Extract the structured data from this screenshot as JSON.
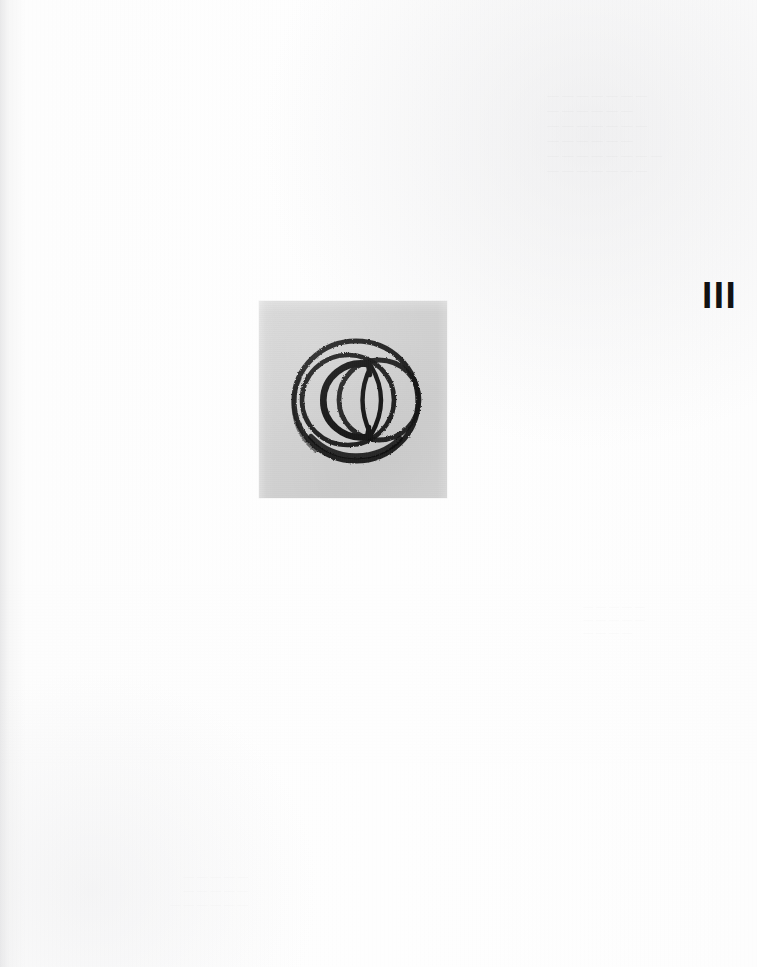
{
  "page": {
    "background_color": "#fdfdfd",
    "width": 757,
    "height": 967
  },
  "plate": {
    "numeral": "III",
    "numeral_color": "#121212"
  },
  "photograph": {
    "caption": "",
    "background_color": "#d3d3d3",
    "ink_color": "#1a1a1a",
    "artwork_title": "",
    "artwork_description": "Abstract brush-and-ink drawing: two overlapping circles forming a vesica-piscis lens, enclosed by a heavy outer ring and an open C-shaped arc",
    "shapes": [
      {
        "name": "outer-ring",
        "type": "circle",
        "cx": 96,
        "cy": 99,
        "r": 63,
        "stroke": 5
      },
      {
        "name": "inner-ring",
        "type": "circle",
        "cx": 88,
        "cy": 98,
        "r": 47,
        "stroke": 5
      },
      {
        "name": "right-overlap-circle",
        "type": "circle",
        "cx": 119,
        "cy": 98,
        "r": 40,
        "stroke": 5
      },
      {
        "name": "open-c-arc",
        "type": "arc",
        "cx": 86,
        "cy": 98,
        "r": 38,
        "stroke": 6
      },
      {
        "name": "vesica-lens",
        "type": "lens",
        "cx": 110,
        "cy": 98,
        "rx": 15,
        "ry": 38
      }
    ]
  },
  "bleed_through": {
    "top_right": "— — — —  — — —\n—  — — —   — —\n— — —   — —  — —\n—  — —   — — —\n— — —  — —  — — —\n— —  — — — — —",
    "mid_right": "— — —  — —\n— —  — — —\n—  — — —",
    "lower_left": "— —  — — —\n— — —  — —\n—  — — —  — —"
  }
}
